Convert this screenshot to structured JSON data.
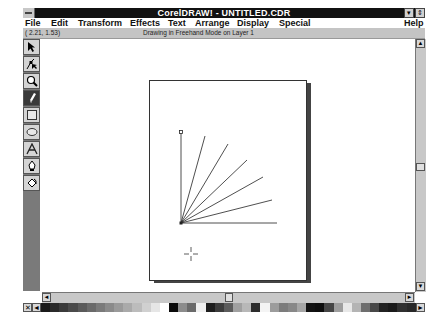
{
  "window": {
    "title": "CorelDRAW! - UNTITLED.CDR",
    "minimize_glyph": "▾",
    "restore_glyph": "⇕"
  },
  "menu": {
    "items": [
      {
        "label": "File",
        "x": 2
      },
      {
        "label": "Edit",
        "x": 28
      },
      {
        "label": "Transform",
        "x": 55
      },
      {
        "label": "Effects",
        "x": 107
      },
      {
        "label": "Text",
        "x": 145
      },
      {
        "label": "Arrange",
        "x": 172
      },
      {
        "label": "Display",
        "x": 214
      },
      {
        "label": "Special",
        "x": 256
      }
    ],
    "help": "Help"
  },
  "status": {
    "coordinates": "( 2.21,  1.53)",
    "message": "Drawing in Freehand Mode on Layer 1"
  },
  "toolbox": {
    "tools": [
      {
        "name": "pick-tool",
        "icon": "arrow-icon"
      },
      {
        "name": "shape-tool",
        "icon": "shape-node-icon"
      },
      {
        "name": "zoom-tool",
        "icon": "magnifier-icon"
      },
      {
        "name": "pencil-tool",
        "icon": "pencil-icon",
        "active": true
      },
      {
        "name": "rectangle-tool",
        "icon": "rectangle-icon"
      },
      {
        "name": "ellipse-tool",
        "icon": "ellipse-icon"
      },
      {
        "name": "text-tool",
        "icon": "text-a-icon"
      },
      {
        "name": "outline-tool",
        "icon": "pen-nib-icon"
      },
      {
        "name": "fill-tool",
        "icon": "paint-bucket-icon"
      }
    ]
  },
  "drawing": {
    "origin": [
      181,
      215
    ],
    "line_endpoints": [
      [
        181,
        124
      ],
      [
        205,
        128
      ],
      [
        228,
        136
      ],
      [
        247,
        152
      ],
      [
        263,
        169
      ],
      [
        272,
        192
      ],
      [
        277,
        215
      ]
    ],
    "cursor": [
      191,
      246
    ]
  },
  "scrollbars": {
    "up_glyph": "▲",
    "down_glyph": "▼",
    "left_glyph": "◄",
    "right_glyph": "►"
  },
  "palette": {
    "no_color_glyph": "✕",
    "left_glyph": "◄",
    "right_glyph": "►",
    "colors": [
      "#1a1a1a",
      "#2a2a2a",
      "#3a3a3a",
      "#4a4a4a",
      "#5a5a5a",
      "#6a6a6a",
      "#7a7a7a",
      "#8a8a8a",
      "#9a9a9a",
      "#aaaaaa",
      "#bcbcbc",
      "#d0d0d0",
      "#e6e6e6",
      "#ffffff",
      "#0a0a0a",
      "#8c8c8c",
      "#6a6a6a",
      "#f0f0f0",
      "#1e1e1e",
      "#3c3c3c",
      "#5c5c5c",
      "#a0a0a0",
      "#b8b8b8",
      "#2c2c2c",
      "#f4f4f4",
      "#9c9c9c",
      "#7c7c7c",
      "#888888",
      "#a6a6a6",
      "#121212",
      "#0e0e0e",
      "#464646",
      "#9e9e9e",
      "#e8e8e8",
      "#b4b4b4",
      "#6e6e6e",
      "#484848",
      "#222222",
      "#1a1a1a",
      "#303030",
      "#282828"
    ]
  }
}
